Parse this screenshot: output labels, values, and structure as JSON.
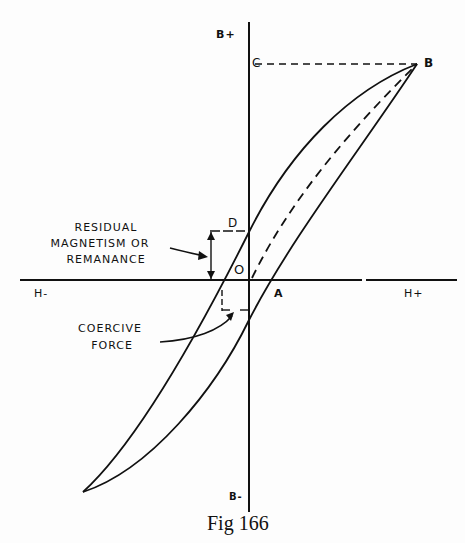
{
  "figure": {
    "caption": "Fig 166"
  },
  "axes": {
    "y_positive": "B+",
    "y_negative": "B-",
    "x_negative": "H-",
    "x_positive": "H+"
  },
  "points": {
    "B": "B",
    "C": "C",
    "D": "D",
    "O": "O",
    "A": "A"
  },
  "annotations": {
    "residual_line1": "RESIDUAL",
    "residual_line2": "MAGNETISM OR",
    "residual_line3": "REMANANCE",
    "coercive_line1": "COERCIVE",
    "coercive_line2": "FORCE"
  },
  "colors": {
    "ink": "#111111",
    "paper": "#fdfdfd"
  }
}
